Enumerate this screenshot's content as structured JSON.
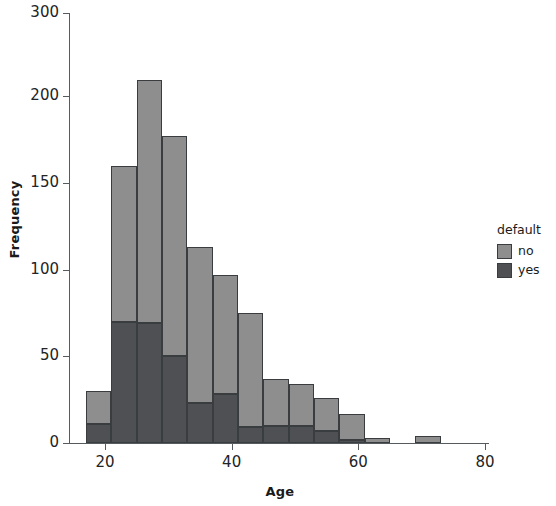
{
  "chart_data": {
    "type": "bar",
    "title": "",
    "xlabel": "Age",
    "ylabel": "Frequency",
    "xlim": [
      16,
      80
    ],
    "ylim": [
      0,
      300
    ],
    "grid": false,
    "stacked": true,
    "legend": {
      "title": "default",
      "position": "right",
      "entries": [
        {
          "name": "no",
          "color": "#8e8e8e"
        },
        {
          "name": "yes",
          "color": "#4e5053"
        }
      ]
    },
    "xticks": [
      20,
      40,
      60,
      80
    ],
    "xtick_labels": [
      "20",
      "40",
      "60",
      "80"
    ],
    "yticks": [
      0,
      50,
      100,
      150,
      200,
      300
    ],
    "ytick_labels": [
      "0",
      "50",
      "100",
      "150",
      "200",
      "300"
    ],
    "bins": [
      {
        "x0": 17,
        "x1": 21,
        "no": 19,
        "yes": 11,
        "total": 30
      },
      {
        "x0": 21,
        "x1": 25,
        "no": 90,
        "yes": 70,
        "total": 160
      },
      {
        "x0": 25,
        "x1": 29,
        "no": 151,
        "yes": 69,
        "total": 220
      },
      {
        "x0": 29,
        "x1": 33,
        "no": 127,
        "yes": 50,
        "total": 177
      },
      {
        "x0": 33,
        "x1": 37,
        "no": 90,
        "yes": 23,
        "total": 113
      },
      {
        "x0": 37,
        "x1": 41,
        "no": 69,
        "yes": 28,
        "total": 97
      },
      {
        "x0": 41,
        "x1": 45,
        "no": 66,
        "yes": 9,
        "total": 75
      },
      {
        "x0": 45,
        "x1": 49,
        "no": 27,
        "yes": 10,
        "total": 37
      },
      {
        "x0": 49,
        "x1": 53,
        "no": 24,
        "yes": 10,
        "total": 34
      },
      {
        "x0": 53,
        "x1": 57,
        "no": 19,
        "yes": 7,
        "total": 26
      },
      {
        "x0": 57,
        "x1": 61,
        "no": 15,
        "yes": 2,
        "total": 17
      },
      {
        "x0": 61,
        "x1": 65,
        "no": 3,
        "yes": 0,
        "total": 3
      },
      {
        "x0": 69,
        "x1": 73,
        "no": 4,
        "yes": 0,
        "total": 4
      }
    ],
    "series": [
      {
        "name": "no",
        "values": [
          19,
          90,
          151,
          127,
          90,
          69,
          66,
          27,
          24,
          19,
          15,
          3,
          4
        ]
      },
      {
        "name": "yes",
        "values": [
          11,
          70,
          69,
          50,
          23,
          28,
          9,
          10,
          10,
          7,
          2,
          0,
          0
        ]
      }
    ],
    "categories": [
      "17-21",
      "21-25",
      "25-29",
      "29-33",
      "33-37",
      "37-41",
      "41-45",
      "45-49",
      "49-53",
      "53-57",
      "57-61",
      "61-65",
      "69-73"
    ]
  },
  "legend": {
    "title": "default",
    "item_no": "no",
    "item_yes": "yes"
  },
  "axes": {
    "x_title": "Age",
    "y_title": "Frequency"
  },
  "colors": {
    "bar_no": "#8e8e8e",
    "bar_yes": "#4e5053",
    "bar_edge": "#3a3d40",
    "axis": "#555b5e",
    "text": "#1a1a1a",
    "background": "#ffffff"
  }
}
